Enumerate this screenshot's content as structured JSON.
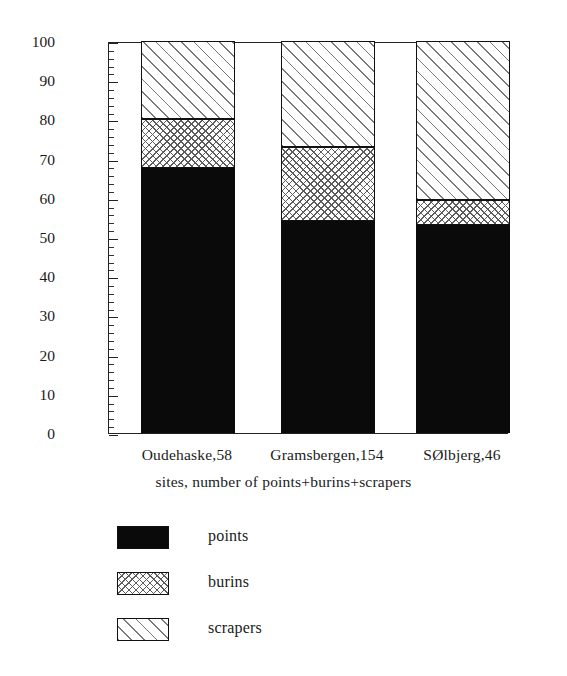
{
  "chart_data": {
    "type": "bar",
    "subtype": "stacked-100-percent",
    "title": "",
    "xlabel": "sites, number of points+burins+scrapers",
    "ylabel": "percentage",
    "categories": [
      "Oudehaske,58",
      "Gramsbergen,154",
      "SØlbjerg,46"
    ],
    "series": [
      {
        "name": "points",
        "pattern": "solid-black",
        "values": [
          67.5,
          54.0,
          53.0
        ]
      },
      {
        "name": "burins",
        "pattern": "cross-hatch",
        "values": [
          12.5,
          19.0,
          6.5
        ]
      },
      {
        "name": "scrapers",
        "pattern": "diagonal-hatch",
        "values": [
          20.0,
          27.0,
          40.5
        ]
      }
    ],
    "cumulative_tops": [
      {
        "category": "Oudehaske,58",
        "points_top": 67.5,
        "burins_top": 80.0,
        "scrapers_top": 100
      },
      {
        "category": "Gramsbergen,154",
        "points_top": 54.0,
        "burins_top": 73.0,
        "scrapers_top": 100
      },
      {
        "category": "SØlbjerg,46",
        "points_top": 53.0,
        "burins_top": 59.5,
        "scrapers_top": 100
      }
    ],
    "ylim": [
      0,
      100
    ],
    "y_major_ticks": [
      0,
      10,
      20,
      30,
      40,
      50,
      60,
      70,
      80,
      90,
      100
    ],
    "y_tick_labels": [
      "0",
      "10",
      "20",
      "30",
      "40",
      "50",
      "60",
      "70",
      "80",
      "90",
      "100"
    ],
    "y_minor_tick_interval": 2,
    "grid": false,
    "legend_position": "below-plot-left",
    "legend_entries": [
      "points",
      "burins",
      "scrapers"
    ],
    "colors": {
      "points": "#0a0a0a",
      "burins_background": "#ffffff",
      "burins_hatch": "#5c5c5c",
      "scrapers_background": "#ffffff",
      "scrapers_hatch": "#7a7a7a",
      "axis": "#222222",
      "text": "#1a1a1a",
      "plot_background": "#ffffff"
    }
  },
  "axes": {
    "y_title": "percentage",
    "x_title": "sites, number of points+burins+scrapers"
  },
  "legend": {
    "items": [
      {
        "label": "points"
      },
      {
        "label": "burins"
      },
      {
        "label": "scrapers"
      }
    ]
  }
}
